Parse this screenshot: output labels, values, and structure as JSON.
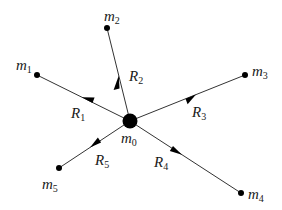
{
  "diagram": {
    "type": "force/vector diagram",
    "center": {
      "name": "m",
      "sub": "0",
      "x": 130,
      "y": 121
    },
    "masses": [
      {
        "name": "m",
        "sub": "1",
        "x": 37,
        "y": 75
      },
      {
        "name": "m",
        "sub": "2",
        "x": 107,
        "y": 28
      },
      {
        "name": "m",
        "sub": "3",
        "x": 245,
        "y": 75
      },
      {
        "name": "m",
        "sub": "4",
        "x": 241,
        "y": 193
      },
      {
        "name": "m",
        "sub": "5",
        "x": 59,
        "y": 168
      }
    ],
    "vectors": [
      {
        "name": "R",
        "sub": "1"
      },
      {
        "name": "R",
        "sub": "2"
      },
      {
        "name": "R",
        "sub": "3"
      },
      {
        "name": "R",
        "sub": "4"
      },
      {
        "name": "R",
        "sub": "5"
      }
    ],
    "colors": {
      "line": "#333333",
      "dot": "#000000",
      "background": "#ffffff"
    }
  }
}
